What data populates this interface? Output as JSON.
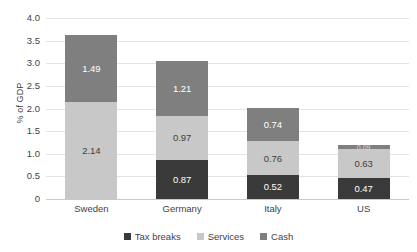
{
  "chart_data": {
    "type": "bar",
    "subtype": "stacked-bar",
    "title": "",
    "xlabel": "",
    "ylabel": "% of GDP",
    "ylim": [
      0,
      4.0
    ],
    "yticks": [
      "4.0",
      "3.5",
      "3.0",
      "2.5",
      "2.0",
      "1.5",
      "1.0",
      "0.5",
      "0"
    ],
    "ytick_values": [
      4.0,
      3.5,
      3.0,
      2.5,
      2.0,
      1.5,
      1.0,
      0.5,
      0
    ],
    "grid": true,
    "legend_position": "bottom",
    "categories": [
      "Sweden",
      "Germany",
      "Italy",
      "US"
    ],
    "series": [
      {
        "name": "Tax breaks",
        "color": "#3a3a3a",
        "values": [
          0,
          0.87,
          0.52,
          0.47
        ],
        "labels": [
          "",
          "0.87",
          "0.52",
          "0.47"
        ]
      },
      {
        "name": "Services",
        "color": "#c8c8c8",
        "values": [
          2.14,
          0.97,
          0.76,
          0.63
        ],
        "labels": [
          "2.14",
          "0.97",
          "0.76",
          "0.63"
        ]
      },
      {
        "name": "Cash",
        "color": "#7f7f7f",
        "values": [
          1.49,
          1.21,
          0.74,
          0.09
        ],
        "labels": [
          "1.49",
          "1.21",
          "0.74",
          "0.09"
        ]
      }
    ],
    "totals": [
      3.63,
      3.05,
      2.02,
      1.19
    ]
  },
  "legend": {
    "items": [
      {
        "label": "Tax breaks"
      },
      {
        "label": "Services"
      },
      {
        "label": "Cash"
      }
    ]
  }
}
